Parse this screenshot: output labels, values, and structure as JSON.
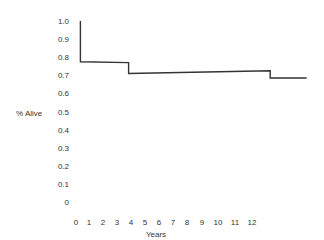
{
  "chart_data": {
    "type": "line",
    "subtype": "step",
    "title": "",
    "xlabel": "Years",
    "ylabel": "% Alive",
    "xlim": [
      0,
      16
    ],
    "ylim": [
      0,
      1.0
    ],
    "x_ticks": [
      "0",
      "1",
      "2",
      "3",
      "4",
      "5",
      "6",
      "7",
      "8",
      "9",
      "10",
      "11",
      "12"
    ],
    "y_ticks": [
      "1.0",
      "0.9",
      "0.8",
      "0.7",
      "0.6",
      "0.5",
      "0.4",
      "0.3",
      "0.2",
      "0.1",
      "0"
    ],
    "grid": false,
    "legend": "none",
    "series": [
      {
        "name": "survival",
        "points": [
          {
            "x": 0.3,
            "y": 1.0
          },
          {
            "x": 0.3,
            "y": 0.775
          },
          {
            "x": 3.6,
            "y": 0.77
          },
          {
            "x": 3.6,
            "y": 0.71
          },
          {
            "x": 13.3,
            "y": 0.725
          },
          {
            "x": 13.3,
            "y": 0.685
          },
          {
            "x": 15.8,
            "y": 0.685
          }
        ]
      }
    ]
  }
}
